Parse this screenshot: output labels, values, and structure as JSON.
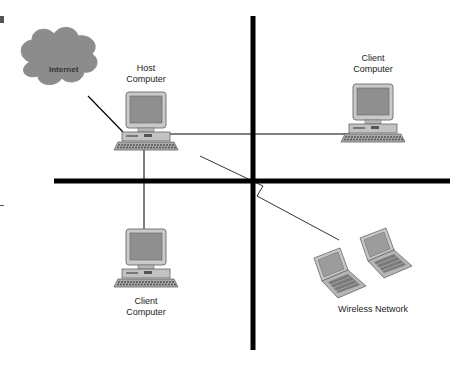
{
  "diagram": {
    "type": "network-topology",
    "nodes": [
      {
        "id": "internet",
        "kind": "cloud",
        "label": "Internet"
      },
      {
        "id": "host",
        "kind": "desktop",
        "label_line1": "Host",
        "label_line2": "Computer"
      },
      {
        "id": "client_top",
        "kind": "desktop",
        "label_line1": "Client",
        "label_line2": "Computer"
      },
      {
        "id": "client_bottom",
        "kind": "desktop",
        "label_line1": "Client",
        "label_line2": "Computer"
      },
      {
        "id": "wireless",
        "kind": "laptop-group",
        "label": "Wireless Network",
        "count": 2
      }
    ],
    "edges": [
      {
        "from": "internet",
        "to": "host",
        "style": "wired"
      },
      {
        "from": "host",
        "to": "client_top",
        "style": "wired"
      },
      {
        "from": "host",
        "to": "client_bottom",
        "style": "wired"
      },
      {
        "from": "host",
        "to": "wireless",
        "style": "wireless-zigzag"
      }
    ],
    "dividers": [
      "vertical",
      "horizontal"
    ]
  },
  "colors": {
    "cloud_fill": "#8c8c8c",
    "device_gray": "#9a9a9a",
    "screen_gray": "#8f8f8f",
    "line": "#000000"
  }
}
